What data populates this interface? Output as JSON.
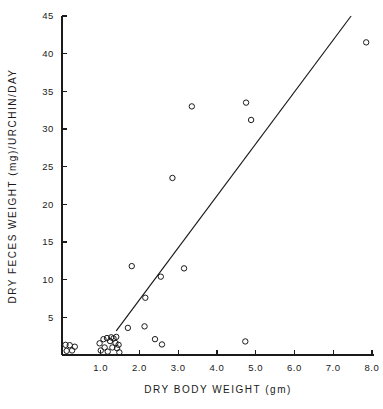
{
  "chart_data": {
    "type": "scatter",
    "title": "",
    "xlabel": "DRY BODY WEIGHT (gm)",
    "ylabel": "DRY FECES WEIGHT (mg)/URCHIN/DAY",
    "xlim": [
      0,
      8.0
    ],
    "ylim": [
      0,
      45
    ],
    "grid": false,
    "legend": null,
    "x_ticks": [
      1.0,
      2.0,
      3.0,
      4.0,
      5.0,
      6.0,
      7.0,
      8.0
    ],
    "x_tick_labels": [
      "1.0",
      "2.0",
      "3.0",
      "4.0",
      "5.0",
      "6.0",
      "7.0",
      "8.0"
    ],
    "y_ticks": [
      5,
      10,
      15,
      20,
      25,
      30,
      35,
      40,
      45
    ],
    "y_tick_labels": [
      "5",
      "10",
      "15",
      "20",
      "25",
      "30",
      "35",
      "40",
      "45"
    ],
    "series": [
      {
        "name": "urchin observations",
        "marker": "open-circle",
        "points": [
          [
            0.09,
            1.35
          ],
          [
            0.12,
            0.55
          ],
          [
            0.2,
            1.3
          ],
          [
            0.26,
            0.6
          ],
          [
            0.33,
            1.1
          ],
          [
            0.97,
            1.55
          ],
          [
            1.0,
            0.6
          ],
          [
            1.07,
            2.1
          ],
          [
            1.1,
            1.0
          ],
          [
            1.16,
            2.25
          ],
          [
            1.18,
            0.45
          ],
          [
            1.24,
            1.85
          ],
          [
            1.27,
            2.35
          ],
          [
            1.3,
            1.0
          ],
          [
            1.33,
            2.2
          ],
          [
            1.38,
            1.6
          ],
          [
            1.4,
            2.4
          ],
          [
            1.42,
            0.9
          ],
          [
            1.46,
            1.35
          ],
          [
            1.48,
            0.35
          ],
          [
            1.7,
            3.6
          ],
          [
            1.8,
            11.8
          ],
          [
            2.13,
            3.8
          ],
          [
            2.15,
            7.6
          ],
          [
            2.4,
            2.1
          ],
          [
            2.55,
            10.4
          ],
          [
            2.58,
            1.4
          ],
          [
            2.85,
            23.5
          ],
          [
            3.15,
            11.5
          ],
          [
            3.35,
            33.0
          ],
          [
            4.73,
            1.8
          ],
          [
            4.75,
            33.5
          ],
          [
            4.88,
            31.2
          ],
          [
            7.85,
            41.5
          ]
        ]
      }
    ],
    "fit_line": {
      "name": "regression line",
      "x_start": 1.4,
      "y_start": 3.2,
      "x_end": 7.46,
      "y_end": 45.0
    }
  },
  "colors": {
    "ink": "#1a1a1a",
    "background": "#ffffff"
  }
}
